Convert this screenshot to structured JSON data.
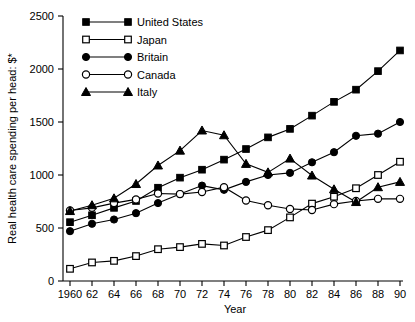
{
  "chart_data": {
    "type": "line",
    "title": "",
    "xlabel": "Year",
    "ylabel": "Real health care spending per head: $*",
    "xlim": [
      1960,
      1990
    ],
    "ylim": [
      0,
      2500
    ],
    "grid": false,
    "legend_position": "top-left",
    "x": [
      1960,
      1962,
      1964,
      1966,
      1968,
      1970,
      1972,
      1974,
      1976,
      1978,
      1980,
      1982,
      1984,
      1986,
      1988,
      1990
    ],
    "xtick_labels": [
      "1960",
      "62",
      "64",
      "66",
      "68",
      "70",
      "72",
      "74",
      "76",
      "78",
      "80",
      "82",
      "84",
      "86",
      "88",
      "90"
    ],
    "ytick_labels": [
      "0",
      "500",
      "1000",
      "1500",
      "2000",
      "2500"
    ],
    "ytick_values": [
      0,
      500,
      1000,
      1500,
      2000,
      2500
    ],
    "series": [
      {
        "name": "United States",
        "marker": "filled-square",
        "values": [
          555,
          620,
          690,
          755,
          880,
          975,
          1050,
          1145,
          1245,
          1355,
          1435,
          1560,
          1690,
          1805,
          1980,
          2175
        ]
      },
      {
        "name": "Japan",
        "marker": "open-square",
        "values": [
          115,
          175,
          190,
          235,
          300,
          320,
          350,
          335,
          415,
          480,
          600,
          730,
          795,
          875,
          1000,
          1125
        ]
      },
      {
        "name": "Britain",
        "marker": "filled-circle",
        "values": [
          470,
          540,
          580,
          640,
          735,
          820,
          900,
          860,
          935,
          1000,
          1020,
          1120,
          1215,
          1370,
          1390,
          1500
        ]
      },
      {
        "name": "Canada",
        "marker": "open-circle",
        "values": [
          665,
          690,
          735,
          770,
          825,
          820,
          840,
          885,
          760,
          715,
          680,
          670,
          725,
          755,
          775,
          775
        ]
      },
      {
        "name": "Italy",
        "marker": "filled-triangle",
        "values": [
          660,
          715,
          780,
          915,
          1090,
          1230,
          1420,
          1375,
          1105,
          1025,
          1155,
          995,
          865,
          745,
          885,
          935
        ]
      }
    ]
  },
  "legend": {
    "entries": [
      {
        "label": "United States"
      },
      {
        "label": "Japan"
      },
      {
        "label": "Britain"
      },
      {
        "label": "Canada"
      },
      {
        "label": "Italy"
      }
    ]
  },
  "axes": {
    "x_title": "Year",
    "y_title": "Real health care spending per head: $*"
  }
}
